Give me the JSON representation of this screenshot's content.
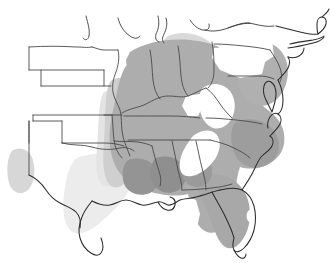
{
  "figure": {
    "name": "species-range-map",
    "region": "Eastern and Southeastern United States",
    "width": 330,
    "height": 263,
    "background_color": "#ffffff",
    "alt_text": "Outline map of the central and eastern United States with gray shaded range covering the Southeast, Florida, the lower Midwest and the mid-Atlantic coast."
  },
  "colors": {
    "absent": "#ffffff",
    "very_light": "#ececec",
    "light": "#dcdcdc",
    "medium_light": "#cccccc",
    "medium": "#adadad",
    "dark": "#9a9a9a",
    "darker": "#8f8f8f",
    "state_border": "#4a4a4a",
    "coastline": "#2b2b2b",
    "lake_outline": "#3a3a3a"
  },
  "legend": {
    "visible": false,
    "classes": [
      {
        "id": "absent",
        "label": "Absent",
        "color": "#ffffff"
      },
      {
        "id": "very-light",
        "label": "Very sparse",
        "color": "#ececec"
      },
      {
        "id": "light",
        "label": "Sparse",
        "color": "#dcdcdc"
      },
      {
        "id": "medium",
        "label": "Common",
        "color": "#adadad"
      },
      {
        "id": "dark",
        "label": "Abundant",
        "color": "#8f8f8f"
      }
    ]
  },
  "annotations": {
    "title": "",
    "subtitle": "",
    "caption": "",
    "scale_bar": "",
    "north_arrow": "",
    "source": ""
  },
  "features": {
    "shaded_regions": [
      {
        "id": "core-southeast",
        "label": "Core southeastern range",
        "class": "medium"
      },
      {
        "id": "florida-peninsula",
        "label": "Florida peninsula",
        "class": "medium"
      },
      {
        "id": "gulf-coast-patches",
        "label": "Gulf coast patches",
        "class": "darker"
      },
      {
        "id": "lower-midwest",
        "label": "Lower Midwest",
        "class": "medium"
      },
      {
        "id": "mid-atlantic-coast",
        "label": "Mid-Atlantic coastal plain",
        "class": "medium"
      },
      {
        "id": "mississippi-valley",
        "label": "Mississippi valley corridor",
        "class": "light"
      },
      {
        "id": "east-texas-blob",
        "label": "East Texas",
        "class": "very_light"
      },
      {
        "id": "west-texas-patch",
        "label": "West Texas / eastern New Mexico patch",
        "class": "light"
      },
      {
        "id": "great-lakes-fringe",
        "label": "Great Lakes fringe",
        "class": "light"
      }
    ],
    "unshaded_gaps": [
      {
        "id": "appalachian-gap",
        "label": "Appalachian gap (West Virginia)"
      },
      {
        "id": "alabama-georgia-band",
        "label": "Alabama–Georgia band"
      },
      {
        "id": "new-york-interior",
        "label": "New York interior"
      },
      {
        "id": "lake-okeechobee",
        "label": "Lake Okeechobee"
      }
    ]
  }
}
